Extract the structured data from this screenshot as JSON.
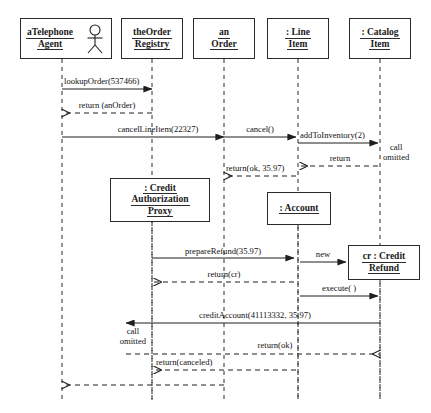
{
  "diagram": {
    "kind": "uml-sequence-diagram",
    "title": "",
    "stroke_color": "#2b2b2b",
    "background_color": "#ffffff"
  },
  "participants": [
    {
      "id": "telephone-agent",
      "name_lines": [
        "aTelephone",
        "Agent"
      ],
      "has_actor_icon": true,
      "icon": "actor-stick-figure-icon",
      "box": {
        "x": 20,
        "y": 18,
        "w": 92,
        "h": 41
      },
      "lifeline_x": 62,
      "lifeline_top": 59,
      "lifeline_bottom": 400
    },
    {
      "id": "order-registry",
      "name_lines": [
        "theOrder",
        "Registry"
      ],
      "has_actor_icon": false,
      "box": {
        "x": 121,
        "y": 18,
        "w": 62,
        "h": 41
      },
      "lifeline_x": 152,
      "lifeline_top": 59,
      "lifeline_bottom": 400
    },
    {
      "id": "an-order",
      "name_lines": [
        "an",
        "Order"
      ],
      "has_actor_icon": false,
      "box": {
        "x": 193,
        "y": 18,
        "w": 62,
        "h": 41
      },
      "lifeline_x": 224,
      "lifeline_top": 59,
      "lifeline_bottom": 400
    },
    {
      "id": "line-item",
      "name_lines": [
        ": Line",
        "Item"
      ],
      "has_actor_icon": false,
      "box": {
        "x": 267,
        "y": 18,
        "w": 62,
        "h": 41
      },
      "lifeline_x": 298,
      "lifeline_top": 59,
      "lifeline_bottom": 400
    },
    {
      "id": "catalog-item",
      "name_lines": [
        ": Catalog",
        "Item"
      ],
      "has_actor_icon": false,
      "box": {
        "x": 349,
        "y": 18,
        "w": 62,
        "h": 41
      },
      "lifeline_x": 380,
      "lifeline_top": 59,
      "lifeline_bottom": 400
    },
    {
      "id": "credit-authorization-proxy",
      "name_lines": [
        ": Credit",
        "Authorization",
        "Proxy"
      ],
      "has_actor_icon": false,
      "box": {
        "x": 110,
        "y": 178,
        "w": 100,
        "h": 44
      },
      "lifeline_x": 152,
      "lifeline_top": 222,
      "lifeline_bottom": 400
    },
    {
      "id": "account",
      "name_lines": [
        ": Account"
      ],
      "has_actor_icon": false,
      "box": {
        "x": 267,
        "y": 192,
        "w": 64,
        "h": 33
      },
      "lifeline_x": 298,
      "lifeline_top": 225,
      "lifeline_bottom": 400
    },
    {
      "id": "credit-refund",
      "name_lines": [
        "cr : Credit",
        "Refund"
      ],
      "has_actor_icon": false,
      "box": {
        "x": 348,
        "y": 245,
        "w": 72,
        "h": 35
      },
      "lifeline_x": 380,
      "lifeline_top": 280,
      "lifeline_bottom": 400
    }
  ],
  "messages": [
    {
      "id": "m1",
      "label": "lookupOrder(537466)",
      "kind": "call",
      "from_x": 62,
      "to_x": 152,
      "y": 89,
      "label_x": 64,
      "label_y": 77,
      "align": "left"
    },
    {
      "id": "m2",
      "label": "return (anOrder)",
      "kind": "return",
      "from_x": 152,
      "to_x": 62,
      "y": 113,
      "label_x": 107,
      "label_y": 101,
      "align": "center"
    },
    {
      "id": "m3",
      "label": "cancelLineItem(22327)",
      "kind": "call",
      "from_x": 62,
      "to_x": 224,
      "y": 137,
      "label_x": 158,
      "label_y": 125,
      "align": "center"
    },
    {
      "id": "m4",
      "label": "cancel()",
      "kind": "call",
      "from_x": 224,
      "to_x": 296,
      "y": 137,
      "label_x": 260,
      "label_y": 125,
      "align": "center"
    },
    {
      "id": "m5",
      "label": "addToInventory(2)",
      "kind": "call",
      "from_x": 298,
      "to_x": 378,
      "y": 143,
      "label_x": 300,
      "label_y": 131,
      "align": "left"
    },
    {
      "id": "m6",
      "label": "call\nomitted",
      "kind": "note",
      "from_x": 0,
      "to_x": 0,
      "y": 0,
      "label_x": 383,
      "label_y": 143,
      "align": "left"
    },
    {
      "id": "m7",
      "label": "return",
      "kind": "return",
      "from_x": 378,
      "to_x": 300,
      "y": 166,
      "label_x": 340,
      "label_y": 154,
      "align": "center"
    },
    {
      "id": "m8",
      "label": "return(ok, 35.97)",
      "kind": "return",
      "from_x": 296,
      "to_x": 224,
      "y": 176,
      "label_x": 226,
      "label_y": 164,
      "align": "left"
    },
    {
      "id": "m9",
      "label": "prepareRefund(35.97)",
      "kind": "call",
      "from_x": 152,
      "to_x": 294,
      "y": 258,
      "label_x": 223,
      "label_y": 247,
      "align": "center"
    },
    {
      "id": "m10",
      "label": "new",
      "kind": "call",
      "from_x": 300,
      "to_x": 346,
      "y": 262,
      "label_x": 323,
      "label_y": 250,
      "align": "center"
    },
    {
      "id": "m11",
      "label": "return(cr)",
      "kind": "return",
      "from_x": 294,
      "to_x": 154,
      "y": 282,
      "label_x": 224,
      "label_y": 270,
      "align": "center"
    },
    {
      "id": "m12",
      "label": "execute( )",
      "kind": "call",
      "from_x": 300,
      "to_x": 378,
      "y": 296,
      "label_x": 339,
      "label_y": 284,
      "align": "center"
    },
    {
      "id": "m13",
      "label": "creditAccount(41113332, 35.97)",
      "kind": "call",
      "from_x": 380,
      "to_x": 126,
      "y": 323,
      "label_x": 255,
      "label_y": 311,
      "align": "center"
    },
    {
      "id": "m14",
      "label": "call\nomitted",
      "kind": "note",
      "from_x": 0,
      "to_x": 0,
      "y": 0,
      "label_x": 146,
      "label_y": 327,
      "align": "right"
    },
    {
      "id": "m15",
      "label": "return(ok)",
      "kind": "return",
      "from_x": 126,
      "to_x": 380,
      "y": 354,
      "label_x": 275,
      "label_y": 341,
      "align": "center"
    },
    {
      "id": "m16",
      "label": "return(canceled)",
      "kind": "return",
      "from_x": 296,
      "to_x": 154,
      "y": 370,
      "label_x": 156,
      "label_y": 358,
      "align": "left"
    },
    {
      "id": "m17",
      "label": "",
      "kind": "return",
      "from_x": 224,
      "to_x": 62,
      "y": 385,
      "label_x": 0,
      "label_y": 0,
      "align": "left"
    }
  ]
}
